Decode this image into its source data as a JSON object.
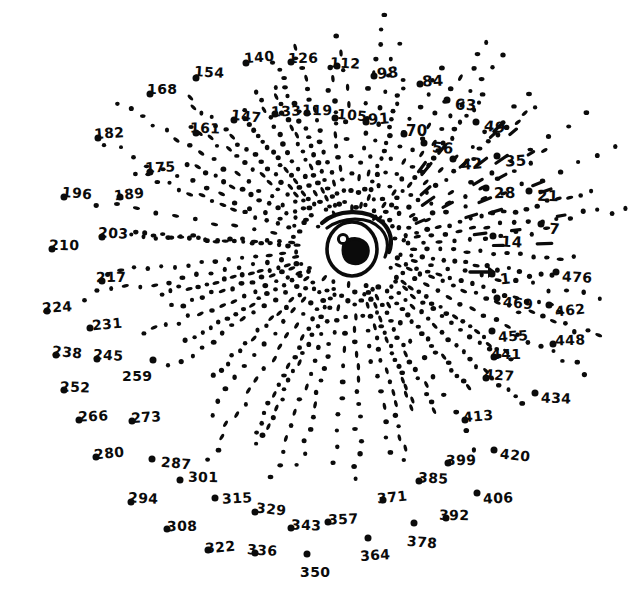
{
  "image": {
    "title": "Connect-the-dots puzzle",
    "subject": "eye",
    "background_color": "#ffffff",
    "ink_color": "#0b0b0b",
    "width": 639,
    "height": 609,
    "style": "hand-drawn marker on white paper",
    "start_marker": "arrow pointing to dot 1",
    "numbering_step": 7,
    "first_number": 1,
    "last_number": 476
  },
  "center_drawing": {
    "name": "eye",
    "parts": [
      "upper-lid-stroke",
      "lower-lid-stroke",
      "iris-circle",
      "pupil-blob",
      "highlight-dot"
    ],
    "cx": 352,
    "cy": 248
  },
  "numbered_dots": [
    {
      "n": "1",
      "lx": 500,
      "ly": 272,
      "dx": 492,
      "dy": 274
    },
    {
      "n": "7",
      "lx": 549,
      "ly": 222,
      "dx": 541,
      "dy": 224
    },
    {
      "n": "14",
      "lx": 501,
      "ly": 235,
      "dx": 493,
      "dy": 236
    },
    {
      "n": "21",
      "lx": 537,
      "ly": 189,
      "dx": 529,
      "dy": 191
    },
    {
      "n": "28",
      "lx": 494,
      "ly": 186,
      "dx": 486,
      "dy": 188
    },
    {
      "n": "35",
      "lx": 505,
      "ly": 154,
      "dx": 497,
      "dy": 156
    },
    {
      "n": "42",
      "lx": 461,
      "ly": 157,
      "dx": 453,
      "dy": 159
    },
    {
      "n": "49",
      "lx": 484,
      "ly": 120,
      "dx": 476,
      "dy": 122
    },
    {
      "n": "56",
      "lx": 432,
      "ly": 141,
      "dx": 424,
      "dy": 143
    },
    {
      "n": "63",
      "lx": 455,
      "ly": 98,
      "dx": 447,
      "dy": 100
    },
    {
      "n": "70",
      "lx": 406,
      "ly": 124,
      "dx": 404,
      "dy": 134
    },
    {
      "n": "84",
      "lx": 422,
      "ly": 74,
      "dx": 420,
      "dy": 84
    },
    {
      "n": "91",
      "lx": 368,
      "ly": 112,
      "dx": 366,
      "dy": 122
    },
    {
      "n": "98",
      "lx": 377,
      "ly": 66,
      "dx": 374,
      "dy": 76
    },
    {
      "n": "105",
      "lx": 337,
      "ly": 108,
      "dx": 335,
      "dy": 118
    },
    {
      "n": "112",
      "lx": 330,
      "ly": 56,
      "dx": 337,
      "dy": 66
    },
    {
      "n": "119",
      "lx": 302,
      "ly": 103,
      "dx": 307,
      "dy": 113
    },
    {
      "n": "126",
      "lx": 288,
      "ly": 51,
      "dx": 291,
      "dy": 62
    },
    {
      "n": "133",
      "lx": 271,
      "ly": 104,
      "dx": 275,
      "dy": 114
    },
    {
      "n": "140",
      "lx": 244,
      "ly": 50,
      "dx": 246,
      "dy": 63
    },
    {
      "n": "147",
      "lx": 231,
      "ly": 109,
      "dx": 234,
      "dy": 120
    },
    {
      "n": "154",
      "lx": 194,
      "ly": 65,
      "dx": 196,
      "dy": 78
    },
    {
      "n": "161",
      "lx": 190,
      "ly": 121,
      "dx": 196,
      "dy": 133
    },
    {
      "n": "168",
      "lx": 147,
      "ly": 82,
      "dx": 150,
      "dy": 94
    },
    {
      "n": "175",
      "lx": 145,
      "ly": 160,
      "dx": 150,
      "dy": 172
    },
    {
      "n": "182",
      "lx": 94,
      "ly": 126,
      "dx": 98,
      "dy": 138
    },
    {
      "n": "189",
      "lx": 114,
      "ly": 187,
      "dx": 120,
      "dy": 197
    },
    {
      "n": "196",
      "lx": 62,
      "ly": 186,
      "dx": 64,
      "dy": 197
    },
    {
      "n": "203",
      "lx": 98,
      "ly": 226,
      "dx": 102,
      "dy": 237
    },
    {
      "n": "210",
      "lx": 49,
      "ly": 238,
      "dx": 52,
      "dy": 249
    },
    {
      "n": "217",
      "lx": 96,
      "ly": 270,
      "dx": 102,
      "dy": 281
    },
    {
      "n": "224",
      "lx": 42,
      "ly": 300,
      "dx": 47,
      "dy": 311
    },
    {
      "n": "231",
      "lx": 92,
      "ly": 317,
      "dx": 90,
      "dy": 328
    },
    {
      "n": "238",
      "lx": 52,
      "ly": 345,
      "dx": 56,
      "dy": 355
    },
    {
      "n": "245",
      "lx": 93,
      "ly": 348,
      "dx": 97,
      "dy": 359
    },
    {
      "n": "252",
      "lx": 60,
      "ly": 380,
      "dx": 64,
      "dy": 390
    },
    {
      "n": "259",
      "lx": 122,
      "ly": 369,
      "dx": 153,
      "dy": 360
    },
    {
      "n": "266",
      "lx": 78,
      "ly": 409,
      "dx": 79,
      "dy": 420
    },
    {
      "n": "273",
      "lx": 131,
      "ly": 410,
      "dx": 132,
      "dy": 421
    },
    {
      "n": "280",
      "lx": 94,
      "ly": 446,
      "dx": 96,
      "dy": 457
    },
    {
      "n": "287",
      "lx": 161,
      "ly": 456,
      "dx": 152,
      "dy": 459
    },
    {
      "n": "294",
      "lx": 128,
      "ly": 491,
      "dx": 131,
      "dy": 502
    },
    {
      "n": "301",
      "lx": 188,
      "ly": 470,
      "dx": 180,
      "dy": 480
    },
    {
      "n": "308",
      "lx": 167,
      "ly": 519,
      "dx": 167,
      "dy": 529
    },
    {
      "n": "315",
      "lx": 222,
      "ly": 491,
      "dx": 215,
      "dy": 498
    },
    {
      "n": "322",
      "lx": 205,
      "ly": 540,
      "dx": 208,
      "dy": 550
    },
    {
      "n": "329",
      "lx": 256,
      "ly": 502,
      "dx": 255,
      "dy": 512
    },
    {
      "n": "336",
      "lx": 247,
      "ly": 543,
      "dx": 255,
      "dy": 553
    },
    {
      "n": "343",
      "lx": 291,
      "ly": 518,
      "dx": 291,
      "dy": 528
    },
    {
      "n": "350",
      "lx": 300,
      "ly": 565,
      "dx": 307,
      "dy": 554
    },
    {
      "n": "357",
      "lx": 328,
      "ly": 512,
      "dx": 328,
      "dy": 522
    },
    {
      "n": "364",
      "lx": 360,
      "ly": 548,
      "dx": 368,
      "dy": 538
    },
    {
      "n": "371",
      "lx": 377,
      "ly": 490,
      "dx": 383,
      "dy": 500
    },
    {
      "n": "378",
      "lx": 407,
      "ly": 535,
      "dx": 414,
      "dy": 523
    },
    {
      "n": "385",
      "lx": 418,
      "ly": 471,
      "dx": 419,
      "dy": 481
    },
    {
      "n": "392",
      "lx": 439,
      "ly": 508,
      "dx": 446,
      "dy": 518
    },
    {
      "n": "399",
      "lx": 446,
      "ly": 453,
      "dx": 448,
      "dy": 463
    },
    {
      "n": "406",
      "lx": 483,
      "ly": 491,
      "dx": 477,
      "dy": 493
    },
    {
      "n": "413",
      "lx": 463,
      "ly": 409,
      "dx": 465,
      "dy": 420
    },
    {
      "n": "420",
      "lx": 500,
      "ly": 448,
      "dx": 494,
      "dy": 450
    },
    {
      "n": "427",
      "lx": 484,
      "ly": 368,
      "dx": 486,
      "dy": 378
    },
    {
      "n": "434",
      "lx": 541,
      "ly": 391,
      "dx": 535,
      "dy": 393
    },
    {
      "n": "441",
      "lx": 491,
      "ly": 347,
      "dx": 494,
      "dy": 357
    },
    {
      "n": "448",
      "lx": 555,
      "ly": 333,
      "dx": 553,
      "dy": 344
    },
    {
      "n": "455",
      "lx": 498,
      "ly": 329,
      "dx": 492,
      "dy": 331
    },
    {
      "n": "462",
      "lx": 555,
      "ly": 303,
      "dx": 549,
      "dy": 305
    },
    {
      "n": "469",
      "lx": 503,
      "ly": 296,
      "dx": 497,
      "dy": 298
    },
    {
      "n": "476",
      "lx": 562,
      "ly": 270,
      "dx": 556,
      "dy": 272
    }
  ]
}
